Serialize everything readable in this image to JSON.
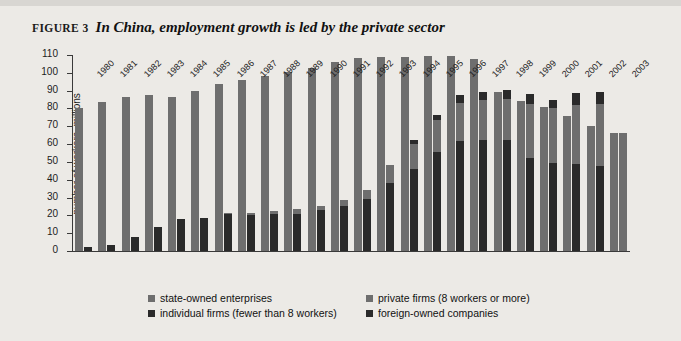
{
  "figure": {
    "label": "Figure 3",
    "title": "In China, employment growth is led by the private sector"
  },
  "legend": {
    "items": [
      {
        "key": "state",
        "label": "state-owned enterprises",
        "color": "#6e6e6e"
      },
      {
        "key": "private",
        "label": "private firms (8 workers or more)",
        "color": "#6e6e6e"
      },
      {
        "key": "individual",
        "label": "individual firms (fewer than 8 workers)",
        "color": "#2a2a2a"
      },
      {
        "key": "foreign",
        "label": "foreign-owned companies",
        "color": "#2a2a2a"
      }
    ]
  },
  "chart_data": {
    "type": "bar",
    "title": "In China, employment growth is led by the private sector",
    "xlabel": "",
    "ylabel": "number of workers, millions",
    "ylim": [
      0,
      110
    ],
    "ytick_step": 10,
    "yticks": [
      0,
      10,
      20,
      30,
      40,
      50,
      60,
      70,
      80,
      90,
      100,
      110
    ],
    "grid": false,
    "legend_position": "bottom",
    "stacked": true,
    "categories": [
      "1980",
      "1981",
      "1982",
      "1983",
      "1984",
      "1985",
      "1986",
      "1987",
      "1988",
      "1989",
      "1990",
      "1991",
      "1992",
      "1993",
      "1994",
      "1995",
      "1996",
      "1997",
      "1998",
      "1999",
      "2000",
      "2001",
      "2002",
      "2003"
    ],
    "series": [
      {
        "name": "state-owned enterprises",
        "color": "#6e6e6e",
        "bar": 1,
        "stack_order": 1,
        "values": [
          80,
          83.5,
          86.5,
          87.5,
          86.5,
          90,
          93.5,
          96,
          98.5,
          100.5,
          102.5,
          106,
          108.5,
          109,
          109,
          109.5,
          109.5,
          107.5,
          89.5,
          84,
          81,
          76,
          70,
          66.5
        ]
      },
      {
        "name": "individual firms (fewer than 8 workers)",
        "color": "#2a2a2a",
        "bar": 2,
        "stack_order": 1,
        "values": [
          2.5,
          3.5,
          8,
          13.5,
          18,
          18.5,
          20.5,
          20,
          21,
          21,
          23,
          25,
          29,
          38,
          46,
          55.5,
          62,
          62.5,
          62.5,
          52,
          49.5,
          49,
          47.5,
          0
        ]
      },
      {
        "name": "private firms (8 workers or more)",
        "color": "#6e6e6e",
        "bar": 2,
        "stack_order": 2,
        "values": [
          0,
          0,
          0,
          0,
          0,
          0,
          1,
          1.5,
          1.5,
          2.5,
          2.5,
          3.5,
          5,
          10,
          14,
          18,
          21,
          22,
          23,
          30.5,
          30.5,
          33,
          35,
          66
        ]
      },
      {
        "name": "foreign-owned companies",
        "color": "#2a2a2a",
        "bar": 2,
        "stack_order": 3,
        "values": [
          0,
          0,
          0,
          0,
          0,
          0,
          0,
          0,
          0,
          0,
          0,
          0,
          0,
          0,
          2.5,
          3,
          4.5,
          4.5,
          5,
          5.5,
          5,
          6.5,
          7,
          0
        ]
      }
    ],
    "bar_totals_note": "Bar 1 = state-owned enterprises. Bar 2 = individual firms + private firms + foreign-owned companies (stacked bottom to top)."
  }
}
